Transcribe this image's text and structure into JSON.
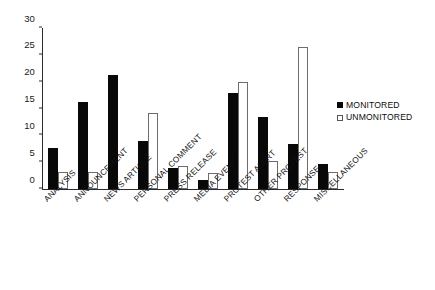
{
  "chart_data": {
    "type": "bar",
    "title": "",
    "subtitle": "",
    "xlabel": "",
    "ylabel": "",
    "ylim": [
      0,
      30
    ],
    "yticks": [
      0,
      5,
      10,
      15,
      20,
      25,
      30
    ],
    "grid": false,
    "legend_position": "right",
    "categories": [
      "ANALYSIS",
      "ANNOUNCEMENT",
      "NEWS ARTICLE",
      "PERSONAL COMMENT",
      "PRESS RELEASE",
      "MEDIA EVENT",
      "PROTEST ALERT",
      "OTHER PROTEST",
      "RESPONSE",
      "MISCELLANEOUS"
    ],
    "series": [
      {
        "name": "MONITORED",
        "color": "#080808",
        "values": [
          7.7,
          16.3,
          21.2,
          9.0,
          4.0,
          1.7,
          17.8,
          13.5,
          8.3,
          4.7
        ]
      },
      {
        "name": "UNMONITORED",
        "color": "#ffffff",
        "values": [
          3.2,
          3.2,
          0,
          14.2,
          4.3,
          3.0,
          20.0,
          5.2,
          26.5,
          3.2
        ]
      }
    ]
  },
  "legend": {
    "entries": [
      {
        "label": "MONITORED",
        "swatch": "filled-square"
      },
      {
        "label": "UNMONITORED",
        "swatch": "open-square"
      }
    ]
  },
  "axes": {
    "y_tick_labels": [
      "0",
      "5",
      "10",
      "15",
      "20",
      "25",
      "30"
    ]
  }
}
